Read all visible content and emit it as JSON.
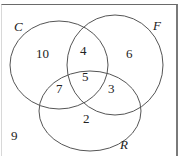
{
  "diagram": {
    "type": "venn",
    "sets": [
      {
        "name": "C",
        "label": "C"
      },
      {
        "name": "F",
        "label": "F"
      },
      {
        "name": "R",
        "label": "R"
      }
    ],
    "regions": {
      "C_only": "10",
      "F_only": "6",
      "R_only": "2",
      "C_and_F_only": "4",
      "C_and_R_only": "7",
      "F_and_R_only": "3",
      "C_and_F_and_R": "5",
      "outside": "9"
    }
  }
}
